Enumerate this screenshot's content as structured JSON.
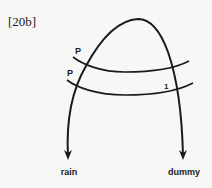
{
  "figure": {
    "label": "[20b]"
  },
  "diagram": {
    "nodes": {
      "upper_p": "P",
      "lower_p": "P",
      "right_one": "1"
    },
    "outputs": {
      "left": "rain",
      "right": "dummy"
    },
    "stroke_color": "#1a1a1a",
    "background": "#f7f7f5"
  }
}
